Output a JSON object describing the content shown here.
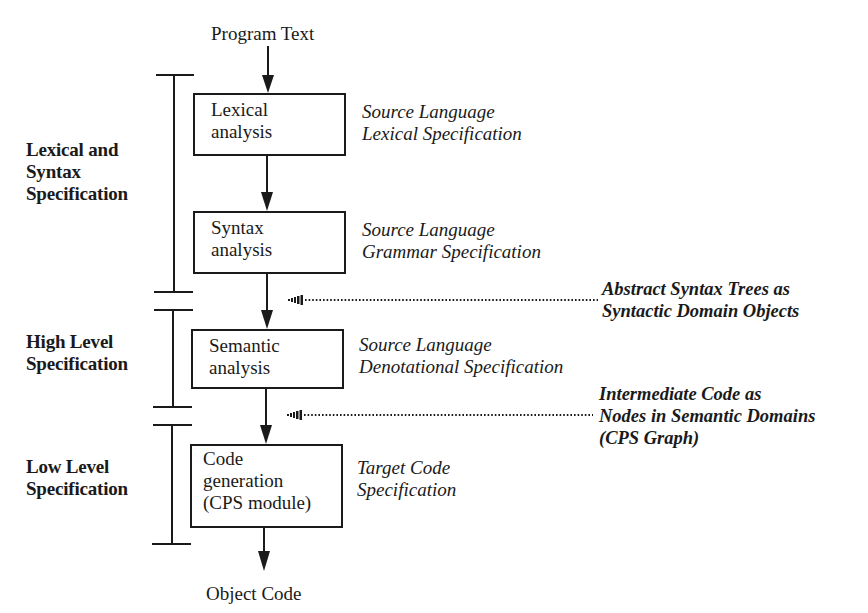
{
  "diagram": {
    "input_label": "Program Text",
    "output_label": "Object Code",
    "stages": [
      {
        "id": "lexical",
        "lines": [
          "Lexical",
          "analysis"
        ],
        "spec": [
          "Source Language",
          "Lexical Specification"
        ]
      },
      {
        "id": "syntax",
        "lines": [
          "Syntax",
          "analysis"
        ],
        "spec": [
          "Source Language",
          "Grammar Specification"
        ]
      },
      {
        "id": "semantic",
        "lines": [
          "Semantic",
          "analysis"
        ],
        "spec": [
          "Source Language",
          "Denotational Specification"
        ]
      },
      {
        "id": "codegen",
        "lines": [
          "Code",
          "generation",
          "(CPS module)"
        ],
        "spec": [
          "Target Code",
          "Specification"
        ]
      }
    ],
    "phases": [
      {
        "id": "lexical-syntax",
        "lines": [
          "Lexical and",
          "Syntax",
          "Specification"
        ]
      },
      {
        "id": "high-level",
        "lines": [
          "High Level",
          "Specification"
        ]
      },
      {
        "id": "low-level",
        "lines": [
          "Low Level",
          "Specification"
        ]
      }
    ],
    "representations": [
      {
        "id": "ast",
        "lines": [
          "Abstract Syntax Trees as",
          "Syntactic Domain Objects"
        ]
      },
      {
        "id": "intermediate",
        "lines": [
          "Intermediate Code as",
          "Nodes in Semantic Domains",
          "(CPS Graph)"
        ]
      }
    ],
    "colors": {
      "ink": "#1a1a1a",
      "background": "#ffffff"
    }
  }
}
